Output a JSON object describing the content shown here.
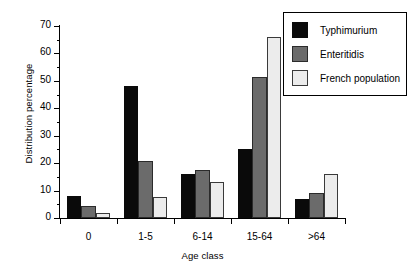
{
  "chart_data": {
    "type": "bar",
    "title": "",
    "xlabel": "Age class",
    "ylabel": "Distribution percentage",
    "categories": [
      "0",
      "1-5",
      "6-14",
      "15-64",
      ">64"
    ],
    "series": [
      {
        "name": "Typhimurium",
        "color": "#0a0a0a",
        "values": [
          8,
          48,
          16,
          25,
          7
        ]
      },
      {
        "name": "Enteritidis",
        "color": "#6b6b6b",
        "values": [
          4.5,
          20.8,
          17.5,
          51.5,
          9
        ]
      },
      {
        "name": "French population",
        "color": "#ececec",
        "values": [
          2,
          7.5,
          13,
          66,
          16
        ]
      }
    ],
    "ylim": [
      0,
      70
    ],
    "ytick_major": [
      0,
      10,
      20,
      30,
      40,
      50,
      60,
      70
    ],
    "ytick_minor": [
      5,
      15,
      25,
      35,
      45,
      55,
      65
    ],
    "ytick_labels": [
      "0",
      "10",
      "20",
      "30",
      "40",
      "50",
      "60",
      "70"
    ],
    "grid": false,
    "legend_position": "top-right"
  },
  "legend": {
    "items": [
      {
        "label": "Typhimurium"
      },
      {
        "label": "Enteritidis"
      },
      {
        "label": "French population"
      }
    ]
  },
  "axes": {
    "y_title": "Distribution percentage",
    "x_title": "Age class"
  }
}
